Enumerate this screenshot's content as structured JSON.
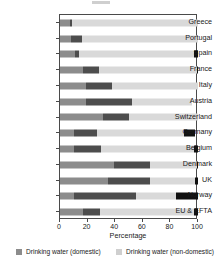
{
  "chart_data": {
    "type": "bar",
    "orientation": "horizontal",
    "stacked": true,
    "title": "",
    "xlabel": "Percentage",
    "ylabel": "",
    "xlim": [
      0,
      100
    ],
    "xticks": [
      0,
      20,
      40,
      60,
      80,
      100
    ],
    "grid": false,
    "legend_position": "bottom",
    "categories": [
      "Greece",
      "Portugal",
      "Spain",
      "France",
      "Italy",
      "Austria",
      "Switzerland",
      "Germany",
      "Belgium",
      "Denmark",
      "UK",
      "Norway",
      "EU & EFTA"
    ],
    "series": [
      {
        "name": "Drinking water (domestic)",
        "color": "#8c8c8c",
        "values": [
          7,
          8,
          11,
          17,
          19,
          19,
          31,
          10,
          10,
          39,
          35,
          10,
          17
        ]
      },
      {
        "name": "Drinking water (non-domestic)",
        "color": "#4d4d4d",
        "values": [
          2,
          8,
          3,
          11,
          19,
          33,
          19,
          17,
          20,
          26,
          30,
          45,
          12
        ]
      },
      {
        "name": "Other",
        "color": "#d9d9d9",
        "values": [
          91,
          84,
          83,
          71,
          62,
          44,
          50,
          63,
          67,
          34,
          33,
          29,
          68
        ]
      },
      {
        "name": "Remainder",
        "color": "#111111",
        "values": [
          0,
          0,
          3,
          1,
          0,
          0,
          0,
          8,
          3,
          1,
          2,
          16,
          3
        ]
      }
    ]
  },
  "legend": {
    "items": [
      {
        "label": "Drinking water (domestic)",
        "color": "#8c8c8c"
      },
      {
        "label": "Drinking water (non-domestic)",
        "color": "#cfcfcf"
      }
    ]
  }
}
